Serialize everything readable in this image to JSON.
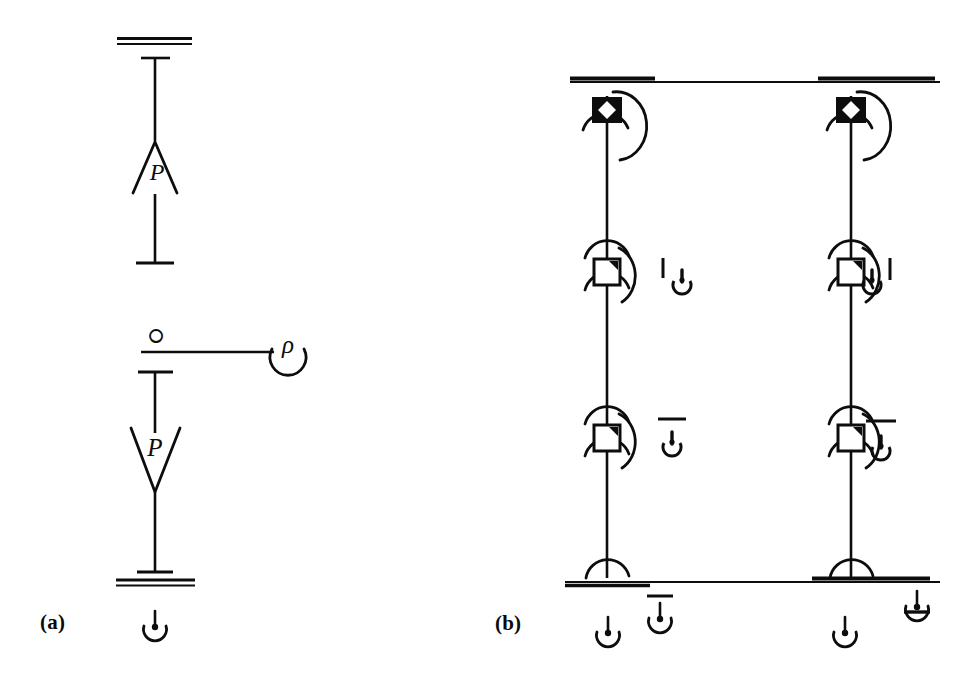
{
  "figure": {
    "type": "hand-drawn-single-line-diagram",
    "background_color": "#ffffff",
    "ink_color": "#0d0d0d",
    "width": 963,
    "height": 692
  },
  "panels": [
    {
      "id": "a",
      "label": "(a)",
      "label_position": {
        "x": 40,
        "y": 610
      },
      "description": "Single feeder branch with two transformer windings between two bus bars",
      "elements": [
        {
          "name": "top-bus-bar",
          "kind": "double-line-bus",
          "x1": 117,
          "x2": 192,
          "y": 41
        },
        {
          "name": "bus-tap-tick",
          "kind": "horizontal-tick",
          "x1": 143,
          "x2": 168,
          "y": 58
        },
        {
          "name": "upper-feeder-line",
          "kind": "vertical-line",
          "x": 155,
          "y1": 58,
          "y2": 140
        },
        {
          "name": "upper-winding",
          "kind": "triangle-up",
          "label": "P",
          "cx": 155,
          "cy": 168
        },
        {
          "name": "mid-feeder-line",
          "kind": "vertical-line",
          "x": 155,
          "y1": 193,
          "y2": 263
        },
        {
          "name": "mid-tick",
          "kind": "horizontal-tick",
          "x1": 138,
          "x2": 172,
          "y": 263
        },
        {
          "name": "tie-line-node-glyph",
          "kind": "glyph",
          "text": "ഠ",
          "x": 155,
          "y": 333
        },
        {
          "name": "tie-horizontal-line",
          "kind": "horizontal-line",
          "x1": 142,
          "x2": 273,
          "y": 352
        },
        {
          "name": "rho-arc-symbol",
          "kind": "rho-with-arc",
          "label": "ρ",
          "cx": 283,
          "cy": 349
        },
        {
          "name": "lower-tap-tick",
          "kind": "horizontal-tick",
          "x1": 140,
          "x2": 172,
          "y": 372
        },
        {
          "name": "lower-feeder-line",
          "kind": "vertical-line",
          "x": 155,
          "y1": 372,
          "y2": 432
        },
        {
          "name": "lower-winding",
          "kind": "triangle-down",
          "label": "P",
          "cx": 155,
          "cy": 455
        },
        {
          "name": "bottom-feeder-line",
          "kind": "vertical-line",
          "x": 155,
          "y1": 490,
          "y2": 572
        },
        {
          "name": "bottom-tick",
          "kind": "horizontal-tick",
          "x1": 138,
          "x2": 172,
          "y": 572
        },
        {
          "name": "bottom-bus-bar",
          "kind": "double-line-bus",
          "x1": 118,
          "x2": 194,
          "y": 582
        },
        {
          "name": "ground-symbol",
          "kind": "ground-plain",
          "cx": 155,
          "cy": 620
        }
      ]
    },
    {
      "id": "b",
      "label": "(b)",
      "label_position": {
        "x": 495,
        "y": 611
      },
      "description": "Two parallel feeders between an upper and a lower bus, each with one breaker and two disconnect devices",
      "buses": [
        {
          "name": "upper-bus",
          "y": 80,
          "x1": 570,
          "x2": 940,
          "thick_segments": [
            [
              570,
              655
            ],
            [
              818,
              935
            ]
          ]
        },
        {
          "name": "lower-bus",
          "y": 580,
          "x1": 565,
          "x2": 940,
          "thick_segments": [
            [
              565,
              650
            ],
            [
              812,
              930
            ]
          ]
        }
      ],
      "feeders": [
        {
          "name": "left-feeder",
          "x": 607,
          "devices": [
            {
              "name": "breaker-closed",
              "kind": "square-filled-breaker",
              "cy": 110
            },
            {
              "name": "disconnect-upper",
              "kind": "square-corner-shaded",
              "cy": 272
            },
            {
              "name": "disconnect-lower",
              "kind": "square-corner-shaded",
              "cy": 438
            }
          ],
          "annotations": [
            {
              "name": "status-indicator-left-tick",
              "kind": "power-glyph-tick-left",
              "x": 673,
              "y": 270
            },
            {
              "name": "status-indicator-overbar",
              "kind": "power-glyph-overbar",
              "x": 672,
              "y": 432
            }
          ]
        },
        {
          "name": "right-feeder",
          "x": 851,
          "devices": [
            {
              "name": "breaker-closed",
              "kind": "square-filled-breaker",
              "cy": 110
            },
            {
              "name": "disconnect-upper",
              "kind": "square-corner-shaded",
              "cy": 272
            },
            {
              "name": "disconnect-lower",
              "kind": "square-corner-shaded",
              "cy": 438
            }
          ],
          "annotations": [
            {
              "name": "status-indicator-right-tick",
              "kind": "power-glyph-tick-right",
              "x": 880,
              "y": 270
            },
            {
              "name": "status-indicator-overbar",
              "kind": "power-glyph-overbar",
              "x": 880,
              "y": 434
            }
          ]
        }
      ],
      "ground_symbols": [
        {
          "name": "ground-left-feeder",
          "kind": "ground-plain",
          "cx": 608,
          "cy": 625
        },
        {
          "name": "ground-left-annotation",
          "kind": "ground-overbar",
          "cx": 660,
          "cy": 613
        },
        {
          "name": "ground-right-feeder",
          "kind": "ground-plain",
          "cx": 845,
          "cy": 625
        },
        {
          "name": "ground-right-annotation",
          "kind": "ground-underbar",
          "cx": 917,
          "cy": 603
        }
      ]
    }
  ],
  "symbol_legend": {
    "triangle_up_label": "P",
    "triangle_down_label": "P",
    "rho_label": "ρ",
    "node_glyph": "ഠ"
  }
}
